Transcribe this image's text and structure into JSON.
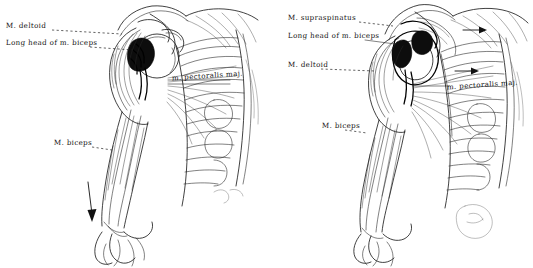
{
  "figure": {
    "background_color": "#ffffff",
    "ink_color": "#111111",
    "width": 533,
    "height": 268
  },
  "panels": [
    {
      "id": "left",
      "name": "left-dissection-view",
      "caption": "Anterior shoulder with deltoid reflected, biceps long head exposed",
      "labels": [
        {
          "id": "l-deltoid",
          "text": "M. deltoid",
          "x": 6,
          "y": 26,
          "leader": true,
          "leader_style": "dashed"
        },
        {
          "id": "l-long-head-biceps",
          "text": "Long head of  m. biceps",
          "x": 6,
          "y": 43,
          "leader": true,
          "leader_style": "dashed"
        },
        {
          "id": "l-pectoralis",
          "text": "m. pectoralis maj.",
          "x": 172,
          "y": 76,
          "leader": true,
          "leader_style": "solid"
        },
        {
          "id": "l-biceps",
          "text": "M. biceps",
          "x": 54,
          "y": 143,
          "leader": true,
          "leader_style": "dashed"
        }
      ],
      "arrows": [
        {
          "id": "l-traction-arrow",
          "direction": "down",
          "note": "downward traction arrow beside arm"
        }
      ]
    },
    {
      "id": "right",
      "name": "right-dissection-view",
      "caption": "Shoulder with supraspinatus and deltoid labelled, biceps long head traced",
      "labels": [
        {
          "id": "r-supraspinatus",
          "text": "M. supraspinatus",
          "x": 288,
          "y": 18,
          "leader": true,
          "leader_style": "dashed"
        },
        {
          "id": "r-long-head-biceps",
          "text": "Long head of m. biceps",
          "x": 288,
          "y": 36,
          "leader": true,
          "leader_style": "solid"
        },
        {
          "id": "r-deltoid",
          "text": "M. deltoid",
          "x": 288,
          "y": 65,
          "leader": true,
          "leader_style": "dashed"
        },
        {
          "id": "r-pectoralis",
          "text": "m. pectoralis maj.",
          "x": 447,
          "y": 85,
          "leader": true,
          "leader_style": "solid"
        },
        {
          "id": "r-biceps",
          "text": "M. biceps",
          "x": 322,
          "y": 126,
          "leader": true,
          "leader_style": "dashed"
        }
      ],
      "arrows": [
        {
          "id": "r-pull-arrow-upper",
          "direction": "right",
          "note": "small rightward arrow near supraspinatus insertion"
        },
        {
          "id": "r-pull-arrow-lower",
          "direction": "right",
          "note": "small rightward arrow above pectoralis label"
        }
      ]
    }
  ]
}
